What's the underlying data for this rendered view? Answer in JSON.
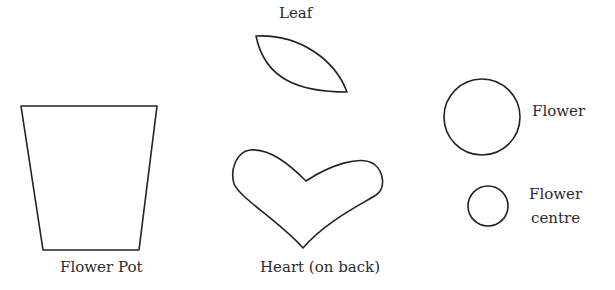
{
  "diagram": {
    "stroke_color": "#222222",
    "background": "#ffffff",
    "shapes": [
      {
        "id": "flower-pot",
        "shape": "trapezoid",
        "label": "Flower Pot"
      },
      {
        "id": "leaf",
        "shape": "leaf",
        "label": "Leaf"
      },
      {
        "id": "heart",
        "shape": "heart",
        "label": "Heart (on back)"
      },
      {
        "id": "flower",
        "shape": "circle",
        "label": "Flower"
      },
      {
        "id": "flower-centre",
        "shape": "circle",
        "label_line1": "Flower",
        "label_line2": "centre"
      }
    ]
  }
}
